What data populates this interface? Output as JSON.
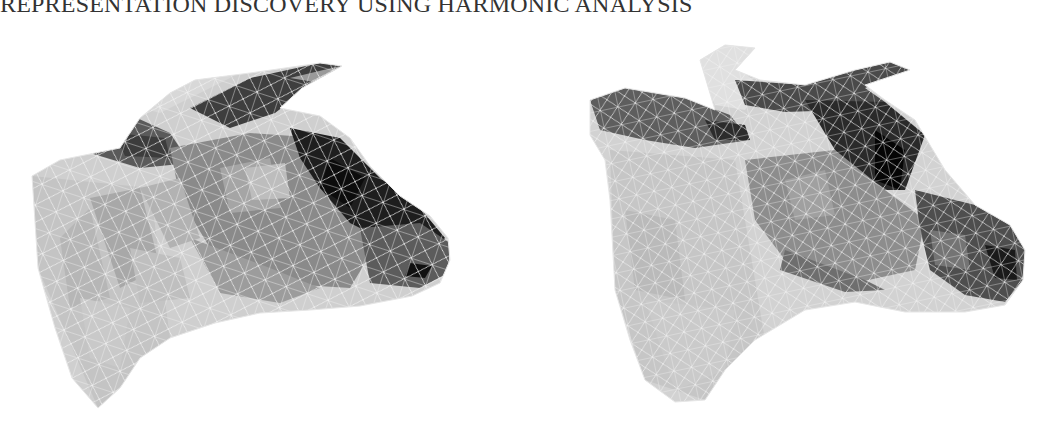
{
  "header": {
    "running_title": "REPRESENTATION DISCOVERY USING HARMONIC ANALYSIS"
  },
  "figure": {
    "panels": [
      {
        "id": "left",
        "subject": "cow head triangle mesh rendering (original)",
        "position": {
          "x": 20,
          "y": 38,
          "w": 440,
          "h": 370
        }
      },
      {
        "id": "right",
        "subject": "cow head triangle mesh rendering (reconstructed)",
        "position": {
          "x": 585,
          "y": 40,
          "w": 445,
          "h": 370
        }
      }
    ],
    "colors": {
      "mesh_line": "#f4f4f4",
      "light_fill": "#c8c8c8",
      "mid_fill": "#8c8c8c",
      "dark_fill": "#2a2a2a"
    }
  }
}
